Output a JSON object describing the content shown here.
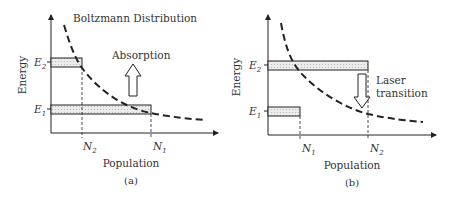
{
  "panels": [
    {
      "id": "a",
      "caption": "(a)",
      "ylabel": "Energy",
      "xlabel": "Population",
      "curve_label": "Boltzmann Distribution",
      "arrow_label": "Absorption",
      "arrow_direction": "up",
      "levels": [
        {
          "name": "E",
          "sub": "2",
          "population": "N",
          "pop_sub": "2"
        },
        {
          "name": "E",
          "sub": "1",
          "population": "N",
          "pop_sub": "1"
        }
      ]
    },
    {
      "id": "b",
      "caption": "(b)",
      "ylabel": "Energy",
      "xlabel": "Population",
      "arrow_label_line1": "Laser",
      "arrow_label_line2": "transition",
      "arrow_direction": "down",
      "levels": [
        {
          "name": "E",
          "sub": "2",
          "population": "N",
          "pop_sub": "2"
        },
        {
          "name": "E",
          "sub": "1",
          "population": "N",
          "pop_sub": "1"
        }
      ]
    }
  ],
  "colors": {
    "line": "#222222",
    "bar_fill": "#e4e4e4",
    "text": "#333333"
  }
}
